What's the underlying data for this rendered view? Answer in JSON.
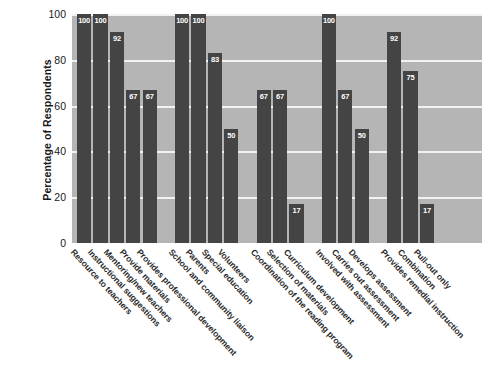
{
  "chart_data": {
    "type": "bar",
    "title": "",
    "subtitle": "",
    "xlabel": "",
    "ylabel": "Percentage of Respondents",
    "ylim": [
      0,
      100
    ],
    "yticks": [
      0,
      20,
      40,
      60,
      80,
      100
    ],
    "grid": true,
    "legend": false,
    "bar_color": "#444444",
    "plot_background": "#b5b5b5",
    "gridline_color": "#f2f2f2",
    "value_label_color": "#ffffff",
    "categories": [
      "Resource to teachers",
      "Instructional suggestions",
      "Mentoring/new teachers",
      "Provide materials",
      "Provides professional development",
      "School and community liaison",
      "Parents",
      "Special education",
      "Volunteers",
      "Coordination of the reading program",
      "Selection of materials",
      "Curriculum development",
      "Involved with assessment",
      "Carries out assessment",
      "Develops assessment",
      "Provides remedial instruction",
      "Combination",
      "Pull-out only"
    ],
    "values": [
      100,
      100,
      92,
      67,
      67,
      100,
      100,
      83,
      50,
      67,
      67,
      17,
      100,
      67,
      50,
      92,
      75,
      17
    ],
    "groups": [
      {
        "name": "group-1",
        "indices": [
          0,
          1,
          2,
          3,
          4
        ]
      },
      {
        "name": "group-2",
        "indices": [
          5,
          6,
          7,
          8
        ]
      },
      {
        "name": "group-3",
        "indices": [
          9,
          10,
          11
        ]
      },
      {
        "name": "group-4",
        "indices": [
          12,
          13,
          14
        ]
      },
      {
        "name": "group-5",
        "indices": [
          15,
          16,
          17
        ]
      }
    ]
  },
  "axes": {
    "y_title": "Percentage of Respondents",
    "y_tick_labels": [
      "100",
      "80",
      "60",
      "40",
      "20",
      "0"
    ]
  },
  "caption": {
    "text": ""
  }
}
